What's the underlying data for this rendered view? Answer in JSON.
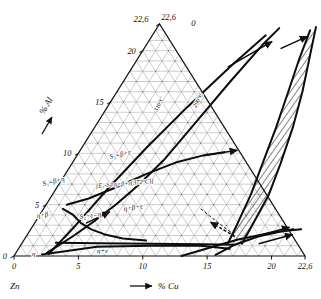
{
  "figure": {
    "type": "ternary-phase-diagram",
    "corner_label": "Zn",
    "apex_left_label": "22,6",
    "apex_right_label": "0"
  },
  "axes": {
    "bottom": {
      "title": "% Cu",
      "arrow": "⟶",
      "ticks": [
        "0",
        "5",
        "10",
        "15",
        "20",
        "22,6"
      ],
      "tick_values": [
        0,
        5,
        10,
        15,
        20,
        22.6
      ]
    },
    "left": {
      "title": "% Al",
      "arrow": "↑",
      "ticks": [
        "0",
        "5",
        "10",
        "15",
        "20",
        "22,6"
      ],
      "tick_values": [
        0,
        5,
        10,
        15,
        20,
        22.6
      ]
    }
  },
  "annotations": [
    {
      "id": "iso-310",
      "text": "310°C",
      "x": 157,
      "y": 112,
      "rot": -62,
      "size": 6.0
    },
    {
      "id": "iso-290",
      "text": "290°C",
      "x": 196,
      "y": 108,
      "rot": -62,
      "size": 6.0
    },
    {
      "id": "reac-s3",
      "text": "S₃=β+ε",
      "x": 110,
      "y": 159,
      "rot": -13,
      "size": 7.0
    },
    {
      "id": "reac-s1",
      "text": "S₁=β+η",
      "x": 43,
      "y": 186,
      "rot": -13,
      "size": 7.0
    },
    {
      "id": "reac-e1",
      "text": "[E₁-S=η+β+ε(372°C)]",
      "x": 96,
      "y": 188,
      "rot": -5,
      "size": 6.3
    },
    {
      "id": "reac-s2",
      "text": "S₂+ε=η",
      "x": 80,
      "y": 219,
      "rot": -8,
      "size": 7.0
    },
    {
      "id": "field-etabe",
      "text": "η+β+ε",
      "x": 124,
      "y": 211,
      "rot": -8,
      "size": 7.0
    },
    {
      "id": "field-etab",
      "text": "η+β",
      "x": 37,
      "y": 218,
      "rot": -8,
      "size": 7.0
    },
    {
      "id": "field-etae",
      "text": "η+ε",
      "x": 97,
      "y": 253,
      "rot": 0,
      "size": 7.0
    },
    {
      "id": "field-eta",
      "text": "η",
      "x": 32,
      "y": 256,
      "rot": 0,
      "size": 7.0
    }
  ],
  "chart_data": {
    "type": "line",
    "title": "",
    "xlabel": "% Cu",
    "ylabel": "% Al",
    "xlim": [
      0,
      22.6
    ],
    "ylim": [
      0,
      22.6
    ],
    "grid": true,
    "grid_step": 1,
    "legend": "none",
    "series": [
      {
        "name": "310°C isotherm (left boundary of hatched band)",
        "points": [
          [
            12.0,
            22.0
          ],
          [
            12.6,
            19.0
          ],
          [
            13.3,
            16.0
          ],
          [
            14.1,
            12.5
          ],
          [
            14.8,
            9.0
          ],
          [
            15.4,
            6.0
          ],
          [
            15.8,
            3.0
          ],
          [
            16.0,
            1.2
          ]
        ]
      },
      {
        "name": "290°C isotherm (right boundary of hatched band)",
        "points": [
          [
            12.3,
            22.3
          ],
          [
            13.4,
            19.0
          ],
          [
            14.4,
            16.0
          ],
          [
            15.4,
            12.5
          ],
          [
            16.2,
            9.0
          ],
          [
            16.8,
            6.0
          ],
          [
            17.0,
            3.0
          ],
          [
            17.1,
            1.2
          ]
        ]
      },
      {
        "name": "S3 = beta + eps monovariant",
        "points": [
          [
            1.6,
            5.0
          ],
          [
            3.0,
            5.6
          ],
          [
            4.6,
            6.7
          ],
          [
            6.3,
            8.0
          ],
          [
            8.0,
            9.1
          ],
          [
            9.8,
            9.8
          ],
          [
            11.3,
            10.1
          ]
        ]
      },
      {
        "name": "S1 = beta + eta monovariant",
        "points": [
          [
            1.5,
            4.6
          ],
          [
            2.6,
            4.0
          ],
          [
            3.6,
            3.2
          ],
          [
            4.7,
            2.6
          ],
          [
            6.0,
            2.1
          ],
          [
            7.6,
            1.7
          ],
          [
            9.5,
            1.5
          ]
        ]
      },
      {
        "name": "eutectic valley E1 (372 C)",
        "points": [
          [
            2.4,
            0.3
          ],
          [
            3.6,
            1.9
          ],
          [
            4.6,
            3.5
          ],
          [
            5.4,
            5.0
          ],
          [
            6.2,
            6.9
          ],
          [
            7.0,
            9.5
          ],
          [
            7.6,
            13.0
          ],
          [
            8.3,
            17.0
          ],
          [
            9.0,
            20.5
          ],
          [
            9.5,
            22.2
          ]
        ]
      },
      {
        "name": "beta phase left boundary",
        "points": [
          [
            2.6,
            0.2
          ],
          [
            3.3,
            3.0
          ],
          [
            4.0,
            6.5
          ],
          [
            5.0,
            10.5
          ],
          [
            6.2,
            14.5
          ],
          [
            7.6,
            18.5
          ],
          [
            8.8,
            21.5
          ]
        ]
      },
      {
        "name": "eta + eps horizontal boundary",
        "points": [
          [
            2.6,
            1.3
          ],
          [
            6.0,
            1.25
          ],
          [
            10.0,
            1.2
          ],
          [
            14.0,
            1.15
          ],
          [
            16.6,
            1.1
          ]
        ]
      },
      {
        "name": "lower eta boundary",
        "points": [
          [
            2.1,
            0.15
          ],
          [
            6.0,
            0.9
          ],
          [
            10.0,
            1.0
          ],
          [
            14.0,
            1.0
          ],
          [
            16.4,
            0.7
          ]
        ]
      },
      {
        "name": "right lower tie line",
        "points": [
          [
            13.0,
            0.0
          ],
          [
            15.0,
            0.9
          ],
          [
            16.6,
            1.6
          ],
          [
            18.6,
            2.2
          ],
          [
            20.4,
            2.6
          ]
        ]
      },
      {
        "name": "right lower tie line 2",
        "points": [
          [
            15.6,
            0.1
          ],
          [
            16.6,
            1.1
          ],
          [
            18.0,
            1.9
          ],
          [
            19.6,
            2.4
          ],
          [
            21.0,
            2.6
          ]
        ]
      }
    ],
    "arrows": [
      {
        "id": "arrow-top-left",
        "from": [
          7.4,
          18.4
        ],
        "to": [
          9.6,
          20.9
        ]
      },
      {
        "id": "arrow-top-right",
        "from": [
          10.6,
          20.2
        ],
        "to": [
          12.1,
          21.4
        ]
      },
      {
        "id": "arrow-s3",
        "from": [
          9.8,
          9.8
        ],
        "to": [
          12.2,
          10.3
        ]
      },
      {
        "id": "arrow-s1",
        "from": [
          4.0,
          3.2
        ],
        "to": [
          5.3,
          4.3
        ]
      },
      {
        "id": "arrow-right-1",
        "from": [
          18.0,
          2.0
        ],
        "to": [
          20.0,
          2.8
        ]
      },
      {
        "id": "arrow-right-2",
        "from": [
          18.4,
          1.2
        ],
        "to": [
          20.6,
          2.1
        ]
      },
      {
        "id": "arrow-e1-dash",
        "from": [
          16.2,
          1.9
        ],
        "to": [
          13.6,
          3.3
        ]
      }
    ],
    "hatch_band": {
      "label_left": "310°C",
      "label_right": "290°C",
      "hatched": true
    }
  }
}
